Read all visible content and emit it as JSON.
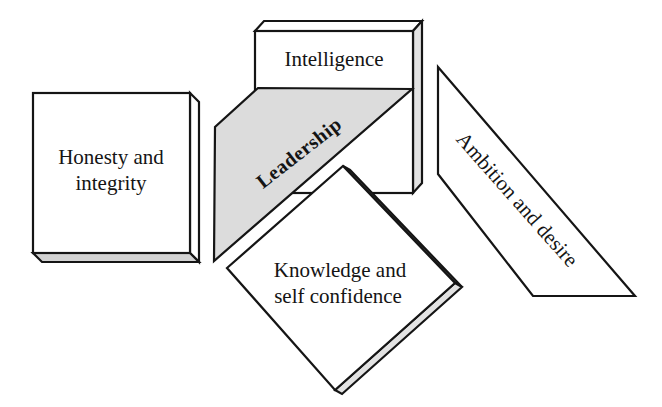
{
  "figure": {
    "type": "leadership-traits-diagram",
    "center_label": "Leadership",
    "traits": {
      "intelligence": "Intelligence",
      "honesty_line1": "Honesty and",
      "honesty_line2": "integrity",
      "knowledge_line1": "Knowledge and",
      "knowledge_line2": "self confidence",
      "ambition": "Ambition and desire"
    }
  },
  "colors": {
    "background": "#ffffff",
    "stroke": "#151515",
    "banner": "#dcdcdc",
    "box_side": "#e3e3e3",
    "box_bottom": "#d2d2d2",
    "diamond_side": "#e2e2e2",
    "text": "#141414"
  }
}
